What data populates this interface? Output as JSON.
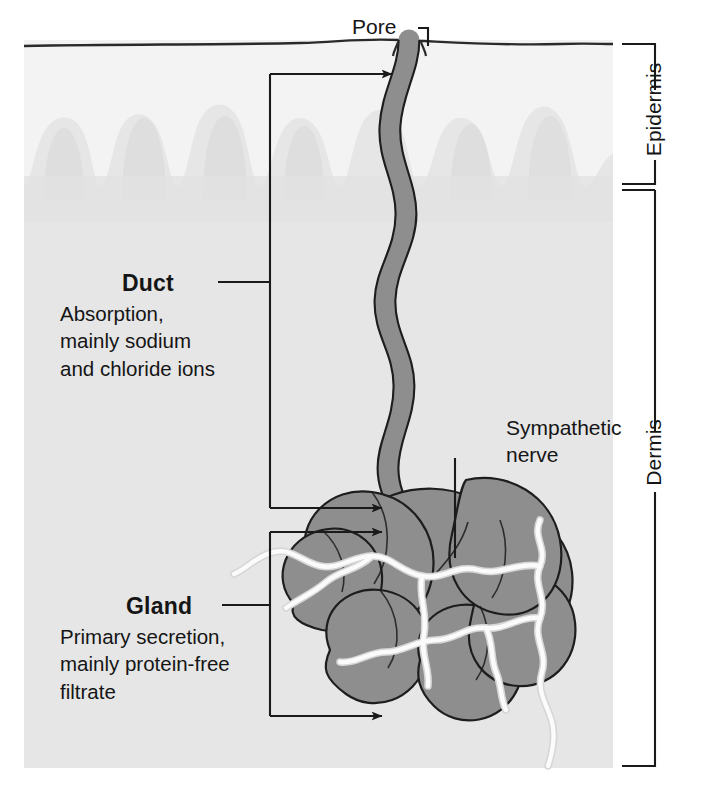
{
  "figure": {
    "canvas": {
      "width": 704,
      "height": 794
    }
  },
  "labels": {
    "pore": "Pore",
    "duct_title": "Duct",
    "duct_description": "Absorption,\nmainly sodium\nand chloride ions",
    "gland_title": "Gland",
    "gland_description": "Primary secretion,\nmainly protein-free\nfiltrate",
    "nerve": "Sympathetic\nnerve",
    "epidermis": "Epidermis",
    "dermis": "Dermis"
  },
  "colors": {
    "background": "#ffffff",
    "epidermis_fill": "#f2f2f2",
    "dermis_fill": "#e6e6e6",
    "papilla_fill": "#e2e2e2",
    "tubule_fill": "#8e8e8e",
    "tubule_stroke": "#1d1d1d",
    "nerve_fill": "#fbfbfb",
    "nerve_stroke": "#d8d8d8",
    "line": "#1a1a1a",
    "text": "#151515"
  },
  "structure": {
    "layers": [
      "Epidermis",
      "Dermis"
    ],
    "parts": [
      "Pore",
      "Duct",
      "Gland",
      "Sympathetic nerve"
    ],
    "pointer_count": 4,
    "bracket_count": 2
  }
}
